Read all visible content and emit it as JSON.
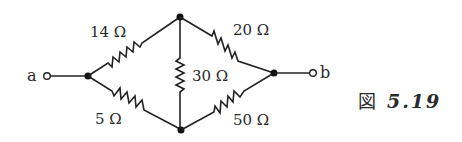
{
  "figure": {
    "caption_prefix": "図",
    "caption_number": "5.19"
  },
  "terminals": {
    "a": "a",
    "b": "b"
  },
  "resistors": {
    "r_left_top": "14 Ω",
    "r_right_top": "20 Ω",
    "r_middle": "30 Ω",
    "r_left_bottom": "5 Ω",
    "r_right_bottom": "50 Ω"
  },
  "colors": {
    "line": "#222222",
    "background": "#ffffff"
  }
}
